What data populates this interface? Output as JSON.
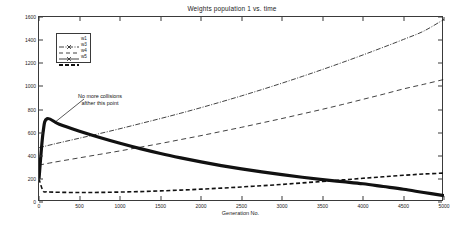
{
  "chart_data": {
    "type": "line",
    "title": "Weights population 1 vs. time",
    "xlabel": "Generation No.",
    "ylabel": "Weight value",
    "xlim": [
      0,
      5000
    ],
    "ylim": [
      0,
      1600
    ],
    "xticks": [
      0,
      500,
      1000,
      1500,
      2000,
      2500,
      3000,
      3500,
      4000,
      4500,
      5000
    ],
    "yticks": [
      0,
      200,
      400,
      600,
      800,
      1000,
      1200,
      1400,
      1600
    ],
    "grid": false,
    "legend_position": "upper-left",
    "annotations": [
      {
        "text_line_1": "No more collisions",
        "text_line_2": "afther this point",
        "points_to_x": 100,
        "points_to_y": 720
      }
    ],
    "x": [
      0,
      50,
      100,
      250,
      500,
      750,
      1000,
      1250,
      1500,
      1750,
      2000,
      2250,
      2500,
      2750,
      3000,
      3250,
      3500,
      3750,
      4000,
      4250,
      4500,
      4750,
      5000
    ],
    "series": [
      {
        "name": "w1",
        "style": "dash-dot",
        "width": 0.8,
        "values": [
          470,
          478,
          487,
          512,
          552,
          592,
          634,
          678,
          722,
          768,
          816,
          866,
          918,
          972,
          1028,
          1086,
          1146,
          1208,
          1272,
          1338,
          1406,
          1478,
          1580
        ]
      },
      {
        "name": "w3",
        "style": "long-dash",
        "width": 0.8,
        "values": [
          320,
          326,
          333,
          352,
          382,
          412,
          442,
          474,
          506,
          540,
          574,
          610,
          646,
          684,
          722,
          762,
          802,
          844,
          888,
          932,
          978,
          1018,
          1060
        ]
      },
      {
        "name": "w4",
        "style": "dashed",
        "width": 1.6,
        "values": [
          200,
          96,
          88,
          84,
          82,
          83,
          86,
          90,
          96,
          103,
          111,
          120,
          130,
          141,
          152,
          165,
          178,
          191,
          205,
          218,
          231,
          242,
          250
        ]
      },
      {
        "name": "w5",
        "style": "solid-thick",
        "width": 3.2,
        "values": [
          200,
          600,
          720,
          672,
          612,
          558,
          508,
          462,
          420,
          382,
          347,
          315,
          286,
          260,
          236,
          214,
          194,
          176,
          158,
          134,
          110,
          82,
          55
        ]
      }
    ]
  },
  "legend": {
    "entries": [
      {
        "label": "w1"
      },
      {
        "label": "w3"
      },
      {
        "label": "w4"
      },
      {
        "label": "w5"
      }
    ]
  }
}
